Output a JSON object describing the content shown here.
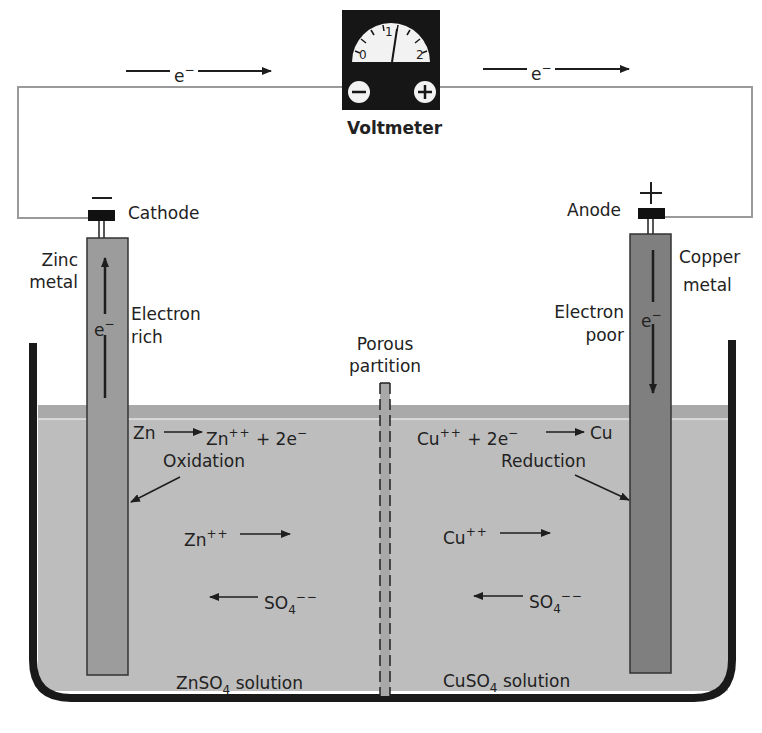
{
  "diagram": {
    "colors": {
      "background": "#ffffff",
      "solution": "#bdbdbd",
      "solution_surface": "#a9a9a9",
      "zinc_electrode": "#9c9c9c",
      "copper_electrode": "#7f7f7f",
      "wire": "#9a9a9a",
      "beaker_wall": "#1a1a1a",
      "voltmeter_body": "#161616",
      "dial_face": "#f2f2f2",
      "text": "#222222"
    },
    "voltmeter": {
      "label": "Voltmeter",
      "scale_ticks": [
        "0",
        "1",
        "2"
      ],
      "negative_terminal": "−",
      "positive_terminal": "+"
    },
    "electron_flow": {
      "left_label": "e",
      "left_charge": "−",
      "right_label": "e",
      "right_charge": "−"
    },
    "left_electrode": {
      "polarity_symbol": "—",
      "terminal_label": "Cathode",
      "metal_label_line1": "Zinc",
      "metal_label_line2": "metal",
      "electron_label_line1": "Electron",
      "electron_label_line2": "rich",
      "electron_symbol": "e",
      "electron_charge": "−"
    },
    "right_electrode": {
      "polarity_symbol": "+",
      "terminal_label": "Anode",
      "metal_label_line1": "Copper",
      "metal_label_line2": "metal",
      "electron_label_line1": "Electron",
      "electron_label_line2": "poor",
      "electron_symbol": "e",
      "electron_charge": "−"
    },
    "partition": {
      "label_line1": "Porous",
      "label_line2": "partition"
    },
    "left_half": {
      "reaction_reactant": "Zn",
      "reaction_product": "Zn",
      "reaction_product_charge": "++",
      "reaction_extra": "+ 2e",
      "reaction_extra_charge": "−",
      "process": "Oxidation",
      "cation": "Zn",
      "cation_charge": "++",
      "anion": "SO",
      "anion_subscript": "4",
      "anion_charge": "−−",
      "solution_prefix": "ZnSO",
      "solution_subscript": "4",
      "solution_suffix": "solution"
    },
    "right_half": {
      "reaction_reactant": "Cu",
      "reaction_reactant_charge": "++",
      "reaction_extra": "+ 2e",
      "reaction_extra_charge": "−",
      "reaction_product": "Cu",
      "process": "Reduction",
      "cation": "Cu",
      "cation_charge": "++",
      "anion": "SO",
      "anion_subscript": "4",
      "anion_charge": "−−",
      "solution_prefix": "CuSO",
      "solution_subscript": "4",
      "solution_suffix": "solution"
    }
  }
}
